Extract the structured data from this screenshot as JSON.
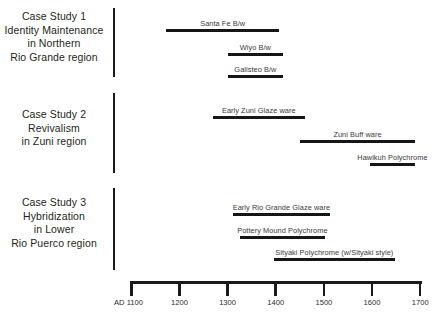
{
  "figure": {
    "background_color": "#ffffff",
    "ink_color": "#1a1a1a",
    "label_color": "#3a3a3a"
  },
  "case_studies": [
    {
      "id": "case-study-1",
      "lines": [
        "Case Study 1",
        "Identity Maintenance",
        "in Northern",
        "Rio Grande region"
      ],
      "wares": [
        {
          "name": "Santa Fe B/w",
          "start": 1175,
          "end": 1410
        },
        {
          "name": "Wiyo B/w",
          "start": 1303,
          "end": 1418
        },
        {
          "name": "Galisteo B/w",
          "start": 1303,
          "end": 1418
        }
      ]
    },
    {
      "id": "case-study-2",
      "lines": [
        "Case Study 2",
        "Revivalism",
        "in Zuni region"
      ],
      "wares": [
        {
          "name": "Early Zuni Glaze ware",
          "start": 1272,
          "end": 1463
        },
        {
          "name": "Zuni Buff ware",
          "start": 1453,
          "end": 1692
        },
        {
          "name": "Hawikuh Polychrome",
          "start": 1598,
          "end": 1692
        }
      ]
    },
    {
      "id": "case-study-3",
      "lines": [
        "Case Study 3",
        "Hybridization",
        "in Lower",
        "Rio Puerco region"
      ],
      "wares": [
        {
          "name": "Early Rio Grande Glaze ware",
          "start": 1314,
          "end": 1515
        },
        {
          "name": "Pottery Mound Polychrome",
          "start": 1328,
          "end": 1505
        },
        {
          "name": "Sityaki Polychrome (w/Sityaki style)",
          "start": 1399,
          "end": 1650
        }
      ]
    }
  ],
  "axis": {
    "ticks": [
      {
        "label": "AD 1100",
        "value": 1100
      },
      {
        "label": "1200",
        "value": 1200
      },
      {
        "label": "1300",
        "value": 1300
      },
      {
        "label": "1400",
        "value": 1400
      },
      {
        "label": "1500",
        "value": 1500
      },
      {
        "label": "1600",
        "value": 1600
      },
      {
        "label": "1700",
        "value": 1700
      }
    ],
    "range": [
      1100,
      1700
    ]
  },
  "chart_data": {
    "type": "bar",
    "title": "",
    "xlabel": "",
    "ylabel": "",
    "orientation": "horizontal-timeline",
    "xlim": [
      1100,
      1700
    ],
    "grid": false,
    "legend": "none",
    "categories": [
      "Santa Fe B/w",
      "Wiyo B/w",
      "Galisteo B/w",
      "Early Zuni Glaze ware",
      "Zuni Buff ware",
      "Hawikuh Polychrome",
      "Early Rio Grande Glaze ware",
      "Pottery Mound Polychrome",
      "Sityaki Polychrome (w/Sityaki style)"
    ],
    "series": [
      {
        "name": "Case Study 1 — Identity Maintenance in Northern Rio Grande region",
        "spans": [
          {
            "label": "Santa Fe B/w",
            "start": 1175,
            "end": 1410
          },
          {
            "label": "Wiyo B/w",
            "start": 1303,
            "end": 1418
          },
          {
            "label": "Galisteo B/w",
            "start": 1303,
            "end": 1418
          }
        ]
      },
      {
        "name": "Case Study 2 — Revivalism in Zuni region",
        "spans": [
          {
            "label": "Early Zuni Glaze ware",
            "start": 1272,
            "end": 1463
          },
          {
            "label": "Zuni Buff ware",
            "start": 1453,
            "end": 1692
          },
          {
            "label": "Hawikuh Polychrome",
            "start": 1598,
            "end": 1692
          }
        ]
      },
      {
        "name": "Case Study 3 — Hybridization in Lower Rio Puerco region",
        "spans": [
          {
            "label": "Early Rio Grande Glaze ware",
            "start": 1314,
            "end": 1515
          },
          {
            "label": "Pottery Mound Polychrome",
            "start": 1328,
            "end": 1505
          },
          {
            "label": "Sityaki Polychrome (w/Sityaki style)",
            "start": 1399,
            "end": 1650
          }
        ]
      }
    ],
    "xticks": [
      1100,
      1200,
      1300,
      1400,
      1500,
      1600,
      1700
    ],
    "xticklabels": [
      "AD 1100",
      "1200",
      "1300",
      "1400",
      "1500",
      "1600",
      "1700"
    ]
  }
}
